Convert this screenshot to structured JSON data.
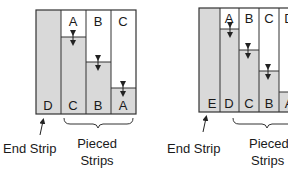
{
  "colors": {
    "fill": "#d9d9d9",
    "line": "#333333",
    "bg": "#ffffff"
  },
  "left": {
    "end_strip_letter": "D",
    "top_letters": [
      "A",
      "B",
      "C"
    ],
    "bottom_letters": [
      "C",
      "B",
      "A"
    ],
    "end_label": "End Strip",
    "pieced_label_1": "Pieced",
    "pieced_label_2": "Strips"
  },
  "right": {
    "end_strip_letter": "E",
    "top_letters": [
      "A",
      "B",
      "C",
      "D"
    ],
    "bottom_letters": [
      "D",
      "C",
      "B",
      "A"
    ],
    "end_label": "End Strip",
    "pieced_label_1": "Pieced",
    "pieced_label_2": "Strips"
  }
}
